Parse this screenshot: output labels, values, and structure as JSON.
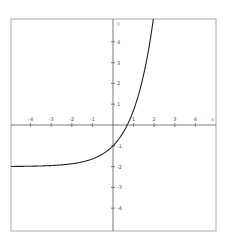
{
  "chart_data": {
    "type": "line",
    "title": "",
    "function": "y = e^x - 2",
    "xlabel": "x",
    "ylabel": "y",
    "xlim": [
      -5.0,
      5.0
    ],
    "ylim": [
      -5.0,
      5.0
    ],
    "grid": false,
    "legend": null,
    "x_ticks": [
      -4,
      -3,
      -2,
      -1,
      1,
      2,
      3,
      4
    ],
    "y_ticks": [
      4,
      3,
      2,
      1,
      -1,
      -2,
      -3,
      -4
    ],
    "series": [
      {
        "name": "f(x)",
        "color": "#222222",
        "x": [
          -5,
          -4,
          -3,
          -2,
          -1,
          0,
          0.693,
          1,
          1.5,
          1.9
        ],
        "y": [
          -1.99,
          -1.98,
          -1.95,
          -1.86,
          -1.63,
          -1.0,
          0.0,
          0.72,
          2.48,
          4.69
        ]
      }
    ],
    "annotations": {
      "horizontal_asymptote": -2,
      "y_intercept": -1,
      "x_intercept": 0.693
    }
  },
  "layout": {
    "frame": {
      "left": 11,
      "top": 19,
      "right": 216,
      "bottom": 231
    },
    "origin_px": {
      "x": 113,
      "y": 125
    },
    "px_per_unit_x": 20.6,
    "px_per_unit_y": 20.8,
    "colors": {
      "frame": "#aaaaaa",
      "axes": "#555555",
      "curve": "#222222",
      "labels": "#555555"
    }
  }
}
